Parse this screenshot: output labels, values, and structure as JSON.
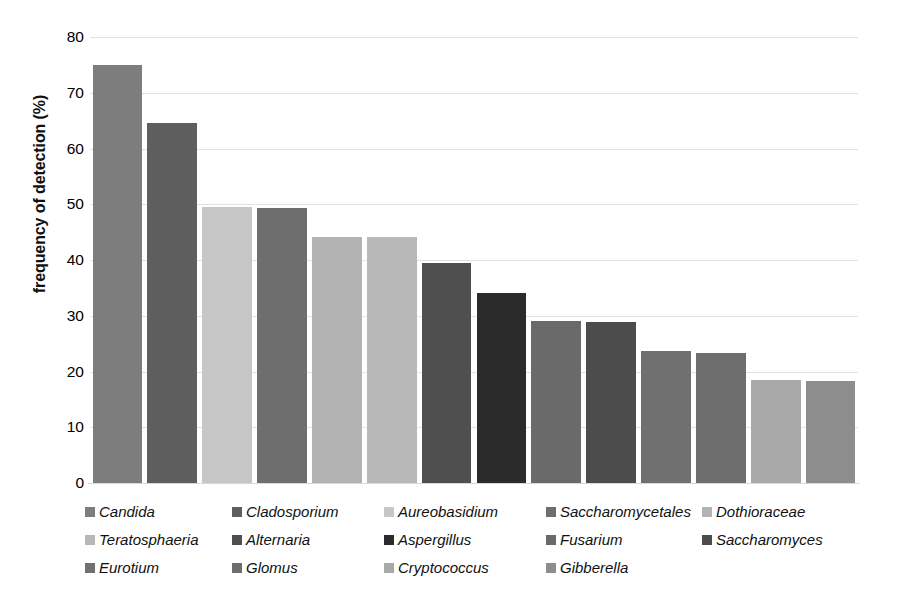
{
  "chart_data": {
    "type": "bar",
    "title": "",
    "xlabel": "",
    "ylabel": "frequency of detection (%)",
    "ylim": [
      0,
      80
    ],
    "yticks": [
      80,
      70,
      60,
      50,
      40,
      30,
      20,
      10,
      0
    ],
    "grid": true,
    "legend_position": "bottom",
    "categories": [
      "Candida",
      "Cladosporium",
      "Aureobasidium",
      "Saccharomycetales",
      "Dothioraceae",
      "Teratosphaeria",
      "Alternaria",
      "Aspergillus",
      "Fusarium",
      "Saccharomyces",
      "Eurotium",
      "Glomus",
      "Cryptococcus",
      "Gibberella"
    ],
    "values": [
      75.0,
      64.5,
      49.5,
      49.3,
      44.2,
      44.1,
      39.4,
      34.1,
      29.0,
      28.8,
      23.6,
      23.4,
      18.4,
      18.3
    ],
    "colors": [
      "#7d7d7d",
      "#5e5e5e",
      "#c6c6c6",
      "#6e6e6e",
      "#b3b3b3",
      "#b8b8b8",
      "#4f4f4f",
      "#2b2b2b",
      "#6a6a6a",
      "#4c4c4c",
      "#707070",
      "#6e6e6e",
      "#a9a9a9",
      "#8d8d8d"
    ]
  },
  "legend": {
    "rows": [
      [
        {
          "label": "Candida",
          "color": "#7d7d7d",
          "x": 85
        },
        {
          "label": "Cladosporium",
          "color": "#5e5e5e",
          "x": 232
        },
        {
          "label": "Aureobasidium",
          "color": "#c6c6c6",
          "x": 384
        },
        {
          "label": "Saccharomycetales",
          "color": "#6e6e6e",
          "x": 546
        },
        {
          "label": "Dothioraceae",
          "color": "#b3b3b3",
          "x": 702
        }
      ],
      [
        {
          "label": "Teratosphaeria",
          "color": "#b8b8b8",
          "x": 85
        },
        {
          "label": "Alternaria",
          "color": "#4f4f4f",
          "x": 232
        },
        {
          "label": "Aspergillus",
          "color": "#2b2b2b",
          "x": 384
        },
        {
          "label": "Fusarium",
          "color": "#6a6a6a",
          "x": 546
        },
        {
          "label": "Saccharomyces",
          "color": "#4c4c4c",
          "x": 702
        }
      ],
      [
        {
          "label": "Eurotium",
          "color": "#707070",
          "x": 85
        },
        {
          "label": "Glomus",
          "color": "#6e6e6e",
          "x": 232
        },
        {
          "label": "Cryptococcus",
          "color": "#a9a9a9",
          "x": 384
        },
        {
          "label": "Gibberella",
          "color": "#8d8d8d",
          "x": 546
        }
      ]
    ]
  }
}
